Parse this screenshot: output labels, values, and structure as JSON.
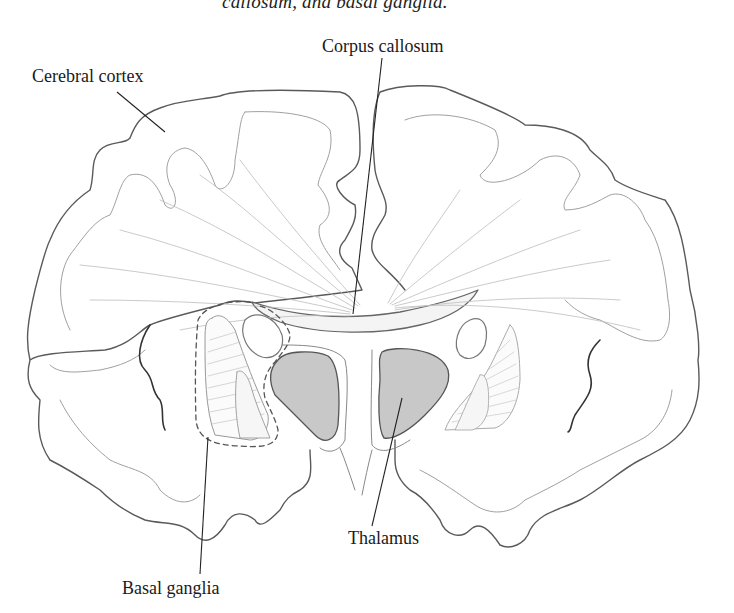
{
  "figure": {
    "caption_fragment": "callosum, and basal ganglia.",
    "type": "coronal section of the brain (line drawing)",
    "labels": {
      "corpus_callosum": "Corpus callosum",
      "cerebral_cortex": "Cerebral cortex",
      "thalamus": "Thalamus",
      "basal_ganglia": "Basal ganglia"
    },
    "colors": {
      "outline": "#555555",
      "inner_outline": "#999999",
      "thalamus_fill": "#c8c8c8",
      "leader_line": "#222222",
      "background": "#ffffff"
    }
  }
}
